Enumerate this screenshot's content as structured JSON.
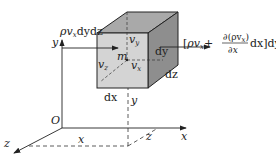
{
  "diagram": {
    "colors": {
      "front_face": "#d4d4d4",
      "top_face": "#a9a9a9",
      "right_face": "#8e8e8e",
      "line": "#222222"
    },
    "axes": {
      "origin_label": "O",
      "x_label": "x",
      "y_label": "y",
      "z_label": "z"
    },
    "dimensions": {
      "dx": "dx",
      "dy": "dy",
      "dz": "dz",
      "x_distance": "x",
      "y_distance": "y",
      "z_distance": "z"
    },
    "point": {
      "label": "m"
    },
    "velocities": {
      "vx": {
        "base": "v",
        "sub": "x"
      },
      "vy": {
        "base": "v",
        "sub": "y"
      },
      "vz": {
        "base": "v",
        "sub": "z"
      }
    },
    "flux_in": {
      "rho": "ρ",
      "v": "v",
      "sub": "x",
      "rest": "dydz"
    },
    "flux_out": {
      "open": "[",
      "rho": "ρ",
      "v": "v",
      "sub": "x",
      "plus": "+",
      "numerator": "∂(ρv",
      "numerator_sub": "x",
      "numerator_close": ")",
      "denominator": "∂x",
      "dx": "dx",
      "close": "]dydz"
    }
  }
}
